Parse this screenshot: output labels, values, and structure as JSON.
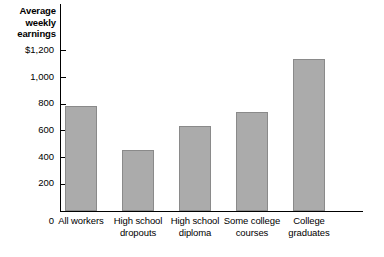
{
  "chart_data": {
    "type": "bar",
    "title": "",
    "ylabel": "Average weekly earnings",
    "xlabel": "",
    "categories": [
      "All workers",
      "High school dropouts",
      "High school diploma",
      "Some college courses",
      "College graduates"
    ],
    "values": [
      790,
      460,
      640,
      740,
      1140
    ],
    "ylim": [
      0,
      1300
    ],
    "yticks": [
      200,
      400,
      600,
      800,
      1000,
      1200
    ],
    "ytick_labels": [
      "200",
      "400",
      "600",
      "800",
      "1,000",
      "$1,200"
    ],
    "origin_label": "0",
    "grid": false,
    "legend": "none",
    "bar_color": "#ababab",
    "bar_border_color": "#8a8a8a",
    "axis_color": "#000000",
    "background": "#ffffff"
  },
  "axis_title_lines": [
    "Average",
    "weekly",
    "earnings"
  ],
  "category_lines": [
    [
      "All workers",
      ""
    ],
    [
      "High school",
      "dropouts"
    ],
    [
      "High school",
      "diploma"
    ],
    [
      "Some college",
      "courses"
    ],
    [
      "College",
      "graduates"
    ]
  ]
}
